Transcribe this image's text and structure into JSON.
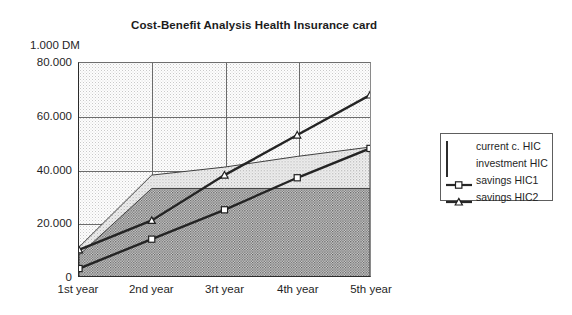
{
  "chart_data": {
    "type": "area",
    "title": "Cost-Benefit Analysis Health Insurance card",
    "unit_label": "1.000 DM",
    "xlabel": "",
    "ylabel": "1.000 DM",
    "categories": [
      "1st year",
      "2nd year",
      "3rt year",
      "4th year",
      "5th year"
    ],
    "ylim": [
      0,
      80000
    ],
    "yticks": [
      0,
      20000,
      40000,
      60000,
      80000
    ],
    "ytick_labels": [
      "0",
      "20.000",
      "40.000",
      "60.000",
      "80.000"
    ],
    "grid": true,
    "legend_position": "right",
    "series": [
      {
        "name": "current c. HIC",
        "type": "area",
        "marker": "none",
        "values": [
          11000,
          38000,
          41000,
          45000,
          48500
        ]
      },
      {
        "name": "investment HIC",
        "type": "area",
        "marker": "none",
        "values": [
          8000,
          33000,
          33000,
          33000,
          33000
        ]
      },
      {
        "name": "savings HIC1",
        "type": "line",
        "marker": "square",
        "values": [
          3000,
          14000,
          25000,
          37000,
          48000
        ]
      },
      {
        "name": "savings HIC2",
        "type": "line",
        "marker": "triangle",
        "values": [
          10000,
          21000,
          38000,
          53000,
          68000
        ]
      }
    ]
  },
  "legend": {
    "items": [
      {
        "label": "current c. HIC",
        "key": "area-light-swatch"
      },
      {
        "label": "investment HIC",
        "key": "area-dark-swatch"
      },
      {
        "label": "savings HIC1",
        "key": "line-square-swatch"
      },
      {
        "label": "savings HIC2",
        "key": "line-triangle-swatch"
      }
    ]
  },
  "colors": {
    "axis": "#2b2b2b",
    "grid": "#6b6b6b",
    "area_light": "#f2f2f2",
    "area_dark": "#d5d5d5",
    "line": "#262626",
    "text": "#1f1f1f",
    "background": "#ffffff"
  }
}
